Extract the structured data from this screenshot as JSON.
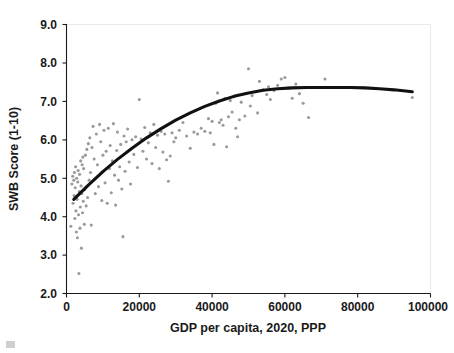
{
  "chart_data": {
    "type": "scatter",
    "title": "",
    "xlabel": "GDP per capita, 2020, PPP",
    "ylabel": "SWB Score (1-10)",
    "xlim": [
      0,
      100000
    ],
    "ylim": [
      2.0,
      9.0
    ],
    "xticks": [
      0,
      20000,
      40000,
      60000,
      80000,
      100000
    ],
    "xticklabels": [
      "0",
      "20000",
      "40000",
      "60000",
      "80000",
      "100000"
    ],
    "yticks": [
      2.0,
      3.0,
      4.0,
      5.0,
      6.0,
      7.0,
      8.0,
      9.0
    ],
    "yticklabels": [
      "2.0",
      "3.0",
      "4.0",
      "5.0",
      "6.0",
      "7.0",
      "8.0",
      "9.0"
    ],
    "grid": false,
    "legend": null,
    "marker_color": "#9a9a9a",
    "marker_size": 2,
    "series": [
      {
        "name": "Countries",
        "type": "scatter",
        "points": [
          [
            1200,
            3.75
          ],
          [
            1500,
            4.85
          ],
          [
            1700,
            5.05
          ],
          [
            1800,
            4.35
          ],
          [
            2000,
            4.95
          ],
          [
            2100,
            4.55
          ],
          [
            2200,
            5.15
          ],
          [
            2300,
            3.95
          ],
          [
            2400,
            4.75
          ],
          [
            2500,
            5.3
          ],
          [
            2600,
            4.15
          ],
          [
            2700,
            3.6
          ],
          [
            2800,
            5.0
          ],
          [
            2900,
            4.45
          ],
          [
            3000,
            3.45
          ],
          [
            3100,
            4.9
          ],
          [
            3200,
            5.2
          ],
          [
            3300,
            4.05
          ],
          [
            3400,
            2.52
          ],
          [
            3500,
            4.65
          ],
          [
            3600,
            5.1
          ],
          [
            3700,
            3.7
          ],
          [
            3800,
            4.25
          ],
          [
            3900,
            5.45
          ],
          [
            4000,
            4.8
          ],
          [
            4100,
            3.18
          ],
          [
            4200,
            4.6
          ],
          [
            4300,
            5.35
          ],
          [
            4400,
            4.1
          ],
          [
            4500,
            5.55
          ],
          [
            4600,
            4.4
          ],
          [
            4700,
            5.25
          ],
          [
            4900,
            3.8
          ],
          [
            5000,
            4.7
          ],
          [
            5200,
            5.6
          ],
          [
            5400,
            4.28
          ],
          [
            5600,
            5.75
          ],
          [
            5800,
            4.5
          ],
          [
            6000,
            5.9
          ],
          [
            6200,
            4.95
          ],
          [
            6400,
            6.05
          ],
          [
            6600,
            5.15
          ],
          [
            6800,
            3.78
          ],
          [
            7000,
            5.8
          ],
          [
            7300,
            6.35
          ],
          [
            7600,
            5.5
          ],
          [
            7900,
            4.6
          ],
          [
            8200,
            6.15
          ],
          [
            8500,
            5.35
          ],
          [
            8800,
            4.78
          ],
          [
            9100,
            6.4
          ],
          [
            9400,
            5.95
          ],
          [
            9700,
            4.42
          ],
          [
            10000,
            5.6
          ],
          [
            10300,
            6.25
          ],
          [
            10600,
            4.88
          ],
          [
            10900,
            5.7
          ],
          [
            11200,
            4.35
          ],
          [
            11500,
            6.3
          ],
          [
            11800,
            5.25
          ],
          [
            12000,
            5.85
          ],
          [
            12300,
            4.62
          ],
          [
            12600,
            5.45
          ],
          [
            12900,
            6.42
          ],
          [
            13200,
            5.08
          ],
          [
            13500,
            4.3
          ],
          [
            13800,
            5.72
          ],
          [
            14000,
            6.2
          ],
          [
            14300,
            4.95
          ],
          [
            14600,
            5.3
          ],
          [
            14900,
            5.88
          ],
          [
            15200,
            4.72
          ],
          [
            15500,
            3.48
          ],
          [
            15800,
            6.1
          ],
          [
            16100,
            5.18
          ],
          [
            16400,
            5.95
          ],
          [
            16800,
            6.28
          ],
          [
            17200,
            5.42
          ],
          [
            17600,
            4.85
          ],
          [
            18000,
            6.0
          ],
          [
            18500,
            5.62
          ],
          [
            19000,
            6.08
          ],
          [
            19500,
            5.28
          ],
          [
            20000,
            7.05
          ],
          [
            20500,
            6.02
          ],
          [
            21000,
            5.7
          ],
          [
            21500,
            6.32
          ],
          [
            22000,
            5.5
          ],
          [
            22500,
            5.92
          ],
          [
            23000,
            6.18
          ],
          [
            23500,
            5.38
          ],
          [
            24000,
            6.4
          ],
          [
            24500,
            5.8
          ],
          [
            25000,
            6.12
          ],
          [
            25500,
            5.25
          ],
          [
            26000,
            6.22
          ],
          [
            26500,
            5.68
          ],
          [
            27000,
            6.15
          ],
          [
            27500,
            5.48
          ],
          [
            28000,
            4.92
          ],
          [
            28500,
            5.58
          ],
          [
            29000,
            6.18
          ],
          [
            29500,
            5.95
          ],
          [
            30000,
            6.05
          ],
          [
            31000,
            6.25
          ],
          [
            32000,
            6.45
          ],
          [
            33000,
            6.1
          ],
          [
            34000,
            5.78
          ],
          [
            35000,
            6.2
          ],
          [
            36000,
            6.15
          ],
          [
            37000,
            6.3
          ],
          [
            38000,
            6.22
          ],
          [
            39000,
            6.55
          ],
          [
            39500,
            6.18
          ],
          [
            40000,
            6.48
          ],
          [
            40500,
            5.88
          ],
          [
            41000,
            6.95
          ],
          [
            41500,
            7.22
          ],
          [
            42000,
            6.45
          ],
          [
            42500,
            6.52
          ],
          [
            43000,
            6.38
          ],
          [
            43500,
            7.08
          ],
          [
            44000,
            5.82
          ],
          [
            44500,
            6.6
          ],
          [
            45000,
            7.02
          ],
          [
            45500,
            6.72
          ],
          [
            46000,
            7.12
          ],
          [
            46500,
            6.3
          ],
          [
            47000,
            6.08
          ],
          [
            47500,
            6.52
          ],
          [
            48000,
            6.98
          ],
          [
            49000,
            6.62
          ],
          [
            50000,
            7.85
          ],
          [
            50500,
            6.88
          ],
          [
            51000,
            7.15
          ],
          [
            52000,
            7.25
          ],
          [
            52500,
            6.7
          ],
          [
            53000,
            7.52
          ],
          [
            54000,
            7.3
          ],
          [
            55000,
            7.18
          ],
          [
            55500,
            7.38
          ],
          [
            56000,
            7.05
          ],
          [
            57000,
            7.28
          ],
          [
            58000,
            7.42
          ],
          [
            59000,
            7.58
          ],
          [
            60000,
            7.62
          ],
          [
            61000,
            7.35
          ],
          [
            62000,
            7.08
          ],
          [
            63000,
            7.45
          ],
          [
            64000,
            7.2
          ],
          [
            65000,
            6.95
          ],
          [
            66500,
            6.58
          ],
          [
            71000,
            7.58
          ],
          [
            95000,
            7.1
          ]
        ]
      },
      {
        "name": "Quadratic trend",
        "type": "line",
        "color": "#111111",
        "linewidth": 3,
        "x_start": 2000,
        "x_end": 95000,
        "peak_x": 80000,
        "peak_y": 7.35,
        "y_start": 4.45,
        "y_end": 7.25,
        "fit_points": [
          [
            2000,
            4.45
          ],
          [
            6000,
            4.82
          ],
          [
            10000,
            5.17
          ],
          [
            14000,
            5.49
          ],
          [
            18000,
            5.78
          ],
          [
            22000,
            6.05
          ],
          [
            26000,
            6.29
          ],
          [
            30000,
            6.51
          ],
          [
            34000,
            6.7
          ],
          [
            38000,
            6.87
          ],
          [
            42000,
            7.01
          ],
          [
            46000,
            7.13
          ],
          [
            50000,
            7.22
          ],
          [
            54000,
            7.29
          ],
          [
            58000,
            7.33
          ],
          [
            62000,
            7.35
          ],
          [
            66000,
            7.36
          ],
          [
            70000,
            7.36
          ],
          [
            74000,
            7.36
          ],
          [
            78000,
            7.36
          ],
          [
            82000,
            7.35
          ],
          [
            86000,
            7.33
          ],
          [
            90000,
            7.3
          ],
          [
            95000,
            7.25
          ]
        ]
      }
    ]
  },
  "axis": {
    "x_title": "GDP per capita, 2020, PPP",
    "y_title": "SWB Score (1-10)"
  }
}
